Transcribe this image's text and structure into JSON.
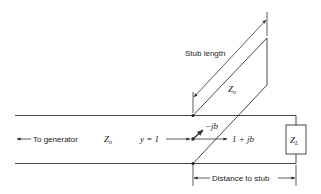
{
  "diagram": {
    "type": "single-stub matching transmission line",
    "labels": {
      "stub_length": "Stub length",
      "to_generator": "To generator",
      "distance_to_stub": "Distance to stub",
      "line_impedance": "Z",
      "line_impedance_sub": "o",
      "stub_impedance": "Z",
      "stub_impedance_sub": "o",
      "load_impedance": "Z",
      "load_impedance_sub": "L",
      "admittance_left": "y = 1",
      "stub_admittance": "−jb",
      "line_admittance_right": "1 + jb"
    },
    "colors": {
      "line": "#333333",
      "text": "#222222",
      "background": "#ffffff"
    }
  }
}
